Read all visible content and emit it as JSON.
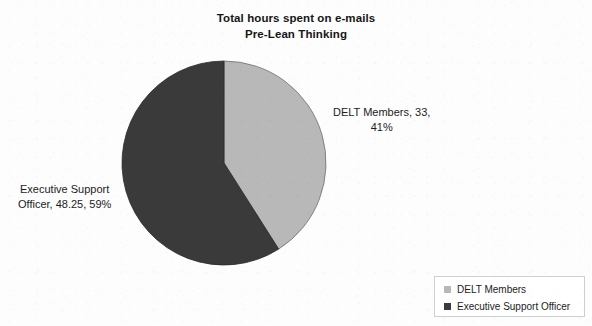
{
  "chart_data": {
    "type": "pie",
    "title": "Total hours spent on e-mails",
    "subtitle": "Pre-Lean Thinking",
    "categories": [
      "DELT Members",
      "Executive Support Officer"
    ],
    "values": [
      33,
      48.25
    ],
    "percentages": [
      41,
      59
    ],
    "total": 81.25,
    "units": "hours",
    "start_angle_deg": 0,
    "direction": "clockwise",
    "colors": [
      "#b8b8b8",
      "#3a3a3a"
    ],
    "legend_position": "bottom-right",
    "grid": false,
    "slices": [
      {
        "name": "DELT Members",
        "value": 33,
        "percent": 41,
        "color": "#b8b8b8",
        "start_deg": 0,
        "end_deg": 147.6,
        "label_line1": "DELT Members, 33,",
        "label_line2": "41%"
      },
      {
        "name": "Executive Support Officer",
        "value": 48.25,
        "percent": 59,
        "color": "#3a3a3a",
        "start_deg": 147.6,
        "end_deg": 360,
        "label_line1": "Executive Support",
        "label_line2": "Officer, 48.25, 59%"
      }
    ]
  },
  "title": {
    "line1": "Total hours spent on e-mails",
    "line2": "Pre-Lean Thinking"
  },
  "labels": {
    "delt": {
      "line1": "DELT Members, 33,",
      "line2": "41%"
    },
    "eso": {
      "line1": "Executive Support",
      "line2": "Officer, 48.25, 59%"
    }
  },
  "legend": {
    "items": [
      {
        "label": "DELT Members",
        "color": "#b8b8b8"
      },
      {
        "label": "Executive Support Officer",
        "color": "#3a3a3a"
      }
    ]
  }
}
